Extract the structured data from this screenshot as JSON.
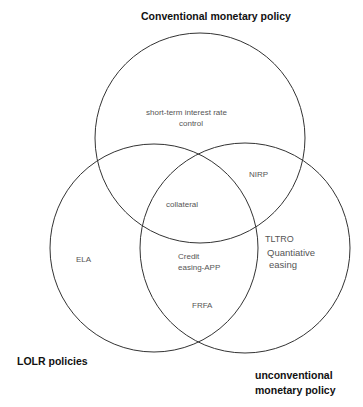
{
  "diagram": {
    "type": "venn",
    "sets": [
      {
        "id": "conventional",
        "label": "Conventional monetary policy"
      },
      {
        "id": "lolr",
        "label": "LOLR policies"
      },
      {
        "id": "unconventional",
        "label": "unconventional monetary policy",
        "label_lines": [
          "unconventional",
          "monetary policy"
        ]
      }
    ],
    "regions": {
      "conventional_only": [
        "short-term interest rate",
        "control"
      ],
      "conventional_unconventional": "NIRP",
      "all_three": "collateral",
      "lolr_only": "ELA",
      "lolr_unconventional": [
        "Credit",
        "easing-APP"
      ],
      "lolr_unconventional_lower": "FRFA",
      "unconventional_only_1": "TLTRO",
      "unconventional_only_2": [
        "Quantiative",
        "easing"
      ]
    },
    "stroke_color": "#333333"
  }
}
